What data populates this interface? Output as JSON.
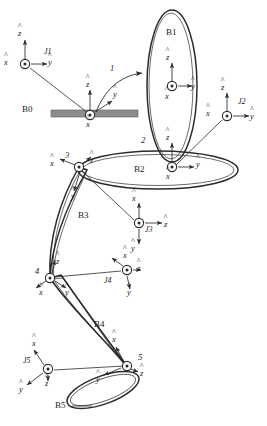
{
  "figure": {
    "type": "kinematic-chain-diagram",
    "stroke_color": "#2b2b2b",
    "ground_color": "#8c8c8c",
    "background_color": "#ffffff"
  },
  "bodies": [
    {
      "id": "B0",
      "label": "B0",
      "shape": "ground-bar",
      "label_x": 22,
      "label_y": 110
    },
    {
      "id": "B1",
      "label": "B1",
      "shape": "tall-vertical-ellipse",
      "label_x": 168,
      "label_y": 33
    },
    {
      "id": "B2",
      "label": "B2",
      "shape": "horizontal-ellipse",
      "label_x": 136,
      "label_y": 170
    },
    {
      "id": "B3",
      "label": "B3",
      "shape": "long-narrow-link",
      "label_x": 80,
      "label_y": 216
    },
    {
      "id": "B4",
      "label": "B4",
      "shape": "long-narrow-link",
      "label_x": 96,
      "label_y": 325
    },
    {
      "id": "B5",
      "label": "B5",
      "shape": "small-tilted-ellipse",
      "label_x": 57,
      "label_y": 406
    }
  ],
  "joint_numbers": [
    {
      "id": "1",
      "label": "1",
      "x": 110,
      "y": 69
    },
    {
      "id": "2",
      "label": "2",
      "x": 142,
      "y": 141
    },
    {
      "id": "3",
      "label": "3",
      "x": 66,
      "y": 156
    },
    {
      "id": "4",
      "label": "4",
      "x": 36,
      "y": 272
    },
    {
      "id": "5",
      "label": "5",
      "x": 139,
      "y": 358
    }
  ],
  "frames": [
    {
      "id": "J1",
      "label": "J1",
      "label_x": 44,
      "label_y": 53,
      "origin_x": 25,
      "origin_y": 64,
      "axes": {
        "x": "out-of-page",
        "y": "right",
        "z": "up"
      },
      "x_label": "x",
      "y_label": "y",
      "z_label": "z",
      "x_label_x": 6,
      "x_label_y": 60,
      "y_label_x": 48,
      "y_label_y": 60,
      "z_label_x": 20,
      "z_label_y": 33
    },
    {
      "id": "B0-frame",
      "label": "",
      "label_x": 0,
      "label_y": 0,
      "origin_x": 90,
      "origin_y": 115,
      "axes": {
        "x": "out-of-page",
        "y": "right",
        "z": "up"
      },
      "x_label": "x",
      "y_label": "y",
      "z_label": "z",
      "x_label_x": 85,
      "x_label_y": 124,
      "y_label_x": 113,
      "y_label_y": 96,
      "z_label_x": 85,
      "z_label_y": 85
    },
    {
      "id": "B1-frame",
      "label": "",
      "label_x": 0,
      "label_y": 0,
      "origin_x": 172,
      "origin_y": 86,
      "axes": {
        "x": "out-of-page",
        "y": "right",
        "z": "up"
      },
      "x_label": "x",
      "y_label": "y",
      "z_label": "z",
      "x_label_x": 166,
      "x_label_y": 96,
      "y_label_x": 192,
      "y_label_y": 86,
      "z_label_x": 167,
      "z_label_y": 59
    },
    {
      "id": "J2",
      "label": "J2",
      "label_x": 238,
      "label_y": 103,
      "origin_x": 227,
      "origin_y": 116,
      "axes": {
        "x": "out-of-page",
        "y": "right",
        "z": "up"
      },
      "x_label": "x",
      "y_label": "y",
      "z_label": "z",
      "x_label_x": 208,
      "x_label_y": 112,
      "y_label_x": 250,
      "y_label_y": 113,
      "z_label_x": 222,
      "z_label_y": 87
    },
    {
      "id": "joint2-frame",
      "label": "",
      "label_x": 0,
      "label_y": 0,
      "origin_x": 172,
      "origin_y": 167,
      "axes": {
        "x": "out-of-page",
        "y": "right",
        "z": "up"
      },
      "x_label": "x",
      "y_label": "y",
      "z_label": "z",
      "x_label_x": 167,
      "x_label_y": 177,
      "y_label_x": 196,
      "y_label_y": 164,
      "z_label_x": 167,
      "z_label_y": 138
    },
    {
      "id": "joint3-frame",
      "label": "",
      "label_x": 0,
      "label_y": 0,
      "origin_x": 79,
      "origin_y": 167,
      "axes": {
        "x": "up-left",
        "y": "down",
        "z": "up-right"
      },
      "x_label": "x",
      "y_label": "y",
      "z_label": "z",
      "x_label_x": 51,
      "x_label_y": 164,
      "y_label_x": 72,
      "y_label_y": 196,
      "z_label_x": 91,
      "z_label_y": 161
    },
    {
      "id": "J3",
      "label": "J3",
      "label_x": 146,
      "label_y": 230,
      "origin_x": 139,
      "origin_y": 223,
      "axes": {
        "x": "up",
        "y": "down",
        "z": "right"
      },
      "x_label": "x",
      "y_label": "y",
      "z_label": "z",
      "x_label_x": 133,
      "x_label_y": 199,
      "y_label_x": 132,
      "y_label_y": 247,
      "z_label_x": 165,
      "z_label_y": 224
    },
    {
      "id": "joint4-frame",
      "label": "",
      "label_x": 0,
      "label_y": 0,
      "origin_x": 50,
      "origin_y": 278,
      "axes": {
        "x": "down-left",
        "y": "down-right",
        "z": "up"
      },
      "x_label": "x",
      "y_label": "y",
      "z_label": "z",
      "x_label_x": 41,
      "x_label_y": 292,
      "y_label_x": 66,
      "y_label_y": 292,
      "z_label_x": 57,
      "z_label_y": 263
    },
    {
      "id": "J4",
      "label": "J4",
      "label_x": 106,
      "label_y": 281,
      "origin_x": 127,
      "origin_y": 270,
      "axes": {
        "x": "up-left",
        "y": "down",
        "z": "right"
      },
      "x_label": "x",
      "y_label": "y",
      "z_label": "z",
      "x_label_x": 125,
      "x_label_y": 256,
      "y_label_x": 128,
      "y_label_y": 291,
      "z_label_x": 137,
      "z_label_y": 269
    },
    {
      "id": "J5",
      "label": "J5",
      "label_x": 24,
      "label_y": 361,
      "origin_x": 48,
      "origin_y": 369,
      "axes": {
        "x": "up-left",
        "y": "down-left",
        "z": "down"
      },
      "x_label": "x",
      "y_label": "y",
      "z_label": "z",
      "x_label_x": 33,
      "x_label_y": 344,
      "y_label_x": 20,
      "y_label_y": 389,
      "z_label_x": 46,
      "z_label_y": 383
    },
    {
      "id": "joint5-frame",
      "label": "",
      "label_x": 0,
      "label_y": 0,
      "origin_x": 127,
      "origin_y": 366,
      "axes": {
        "x": "up-left",
        "y": "left",
        "z": "down-right"
      },
      "x_label": "x",
      "y_label": "y",
      "z_label": "z",
      "x_label_x": 113,
      "x_label_y": 340,
      "y_label_x": 97,
      "y_label_y": 379,
      "z_label_x": 141,
      "z_label_y": 373
    }
  ],
  "annotations": {
    "joint1_arrow_label": "1"
  }
}
